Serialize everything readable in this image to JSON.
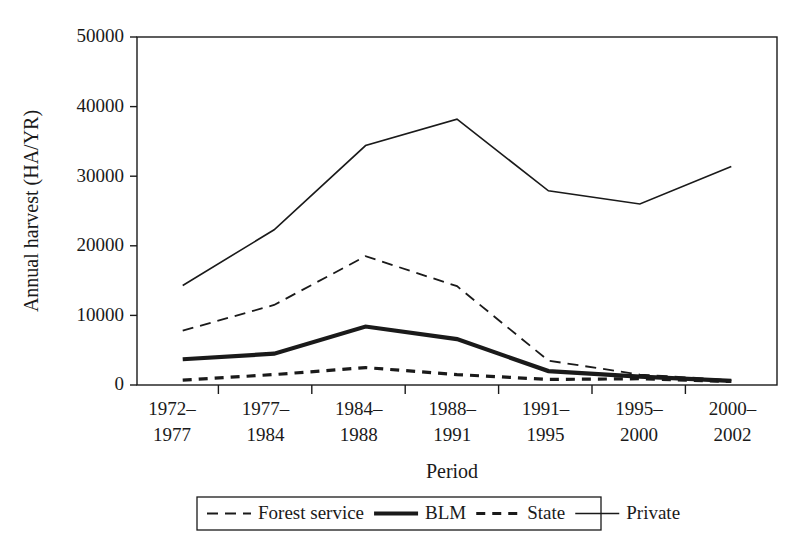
{
  "chart_data": {
    "type": "line",
    "title": "",
    "xlabel": "Period",
    "ylabel": "Annual harvest (HA/YR)",
    "categories": [
      "1972–\n1977",
      "1977–\n1984",
      "1984–\n1988",
      "1988–\n1991",
      "1991–\n1995",
      "1995–\n2000",
      "2000–\n2002"
    ],
    "category_lines": [
      [
        "1972–",
        "1977"
      ],
      [
        "1977–",
        "1984"
      ],
      [
        "1984–",
        "1988"
      ],
      [
        "1988–",
        "1991"
      ],
      [
        "1991–",
        "1995"
      ],
      [
        "1995–",
        "2000"
      ],
      [
        "2000–",
        "2002"
      ]
    ],
    "ylim": [
      0,
      50000
    ],
    "yticks": [
      0,
      10000,
      20000,
      30000,
      40000,
      50000
    ],
    "ytick_labels": [
      "0",
      "10000",
      "20000",
      "30000",
      "40000",
      "50000"
    ],
    "grid": false,
    "legend_position": "bottom",
    "series": [
      {
        "name": "Forest service",
        "style": "long-dash",
        "color": "#1a1a1a",
        "width": 1.8,
        "values": [
          7800,
          11500,
          18500,
          14200,
          3500,
          1500,
          700
        ]
      },
      {
        "name": "BLM",
        "style": "thick-solid",
        "color": "#1a1a1a",
        "width": 4.2,
        "values": [
          3700,
          4500,
          8400,
          6600,
          2000,
          1200,
          600
        ]
      },
      {
        "name": "State",
        "style": "short-dash",
        "color": "#1a1a1a",
        "width": 3.2,
        "values": [
          700,
          1500,
          2500,
          1500,
          800,
          900,
          500
        ]
      },
      {
        "name": "Private",
        "style": "thin-solid",
        "color": "#1a1a1a",
        "width": 1.6,
        "values": [
          14300,
          22300,
          34400,
          38200,
          27900,
          26000,
          31400
        ]
      }
    ]
  },
  "legend": {
    "entries": [
      {
        "label": "Forest service"
      },
      {
        "label": "BLM"
      },
      {
        "label": "State"
      },
      {
        "label": "Private"
      }
    ]
  }
}
